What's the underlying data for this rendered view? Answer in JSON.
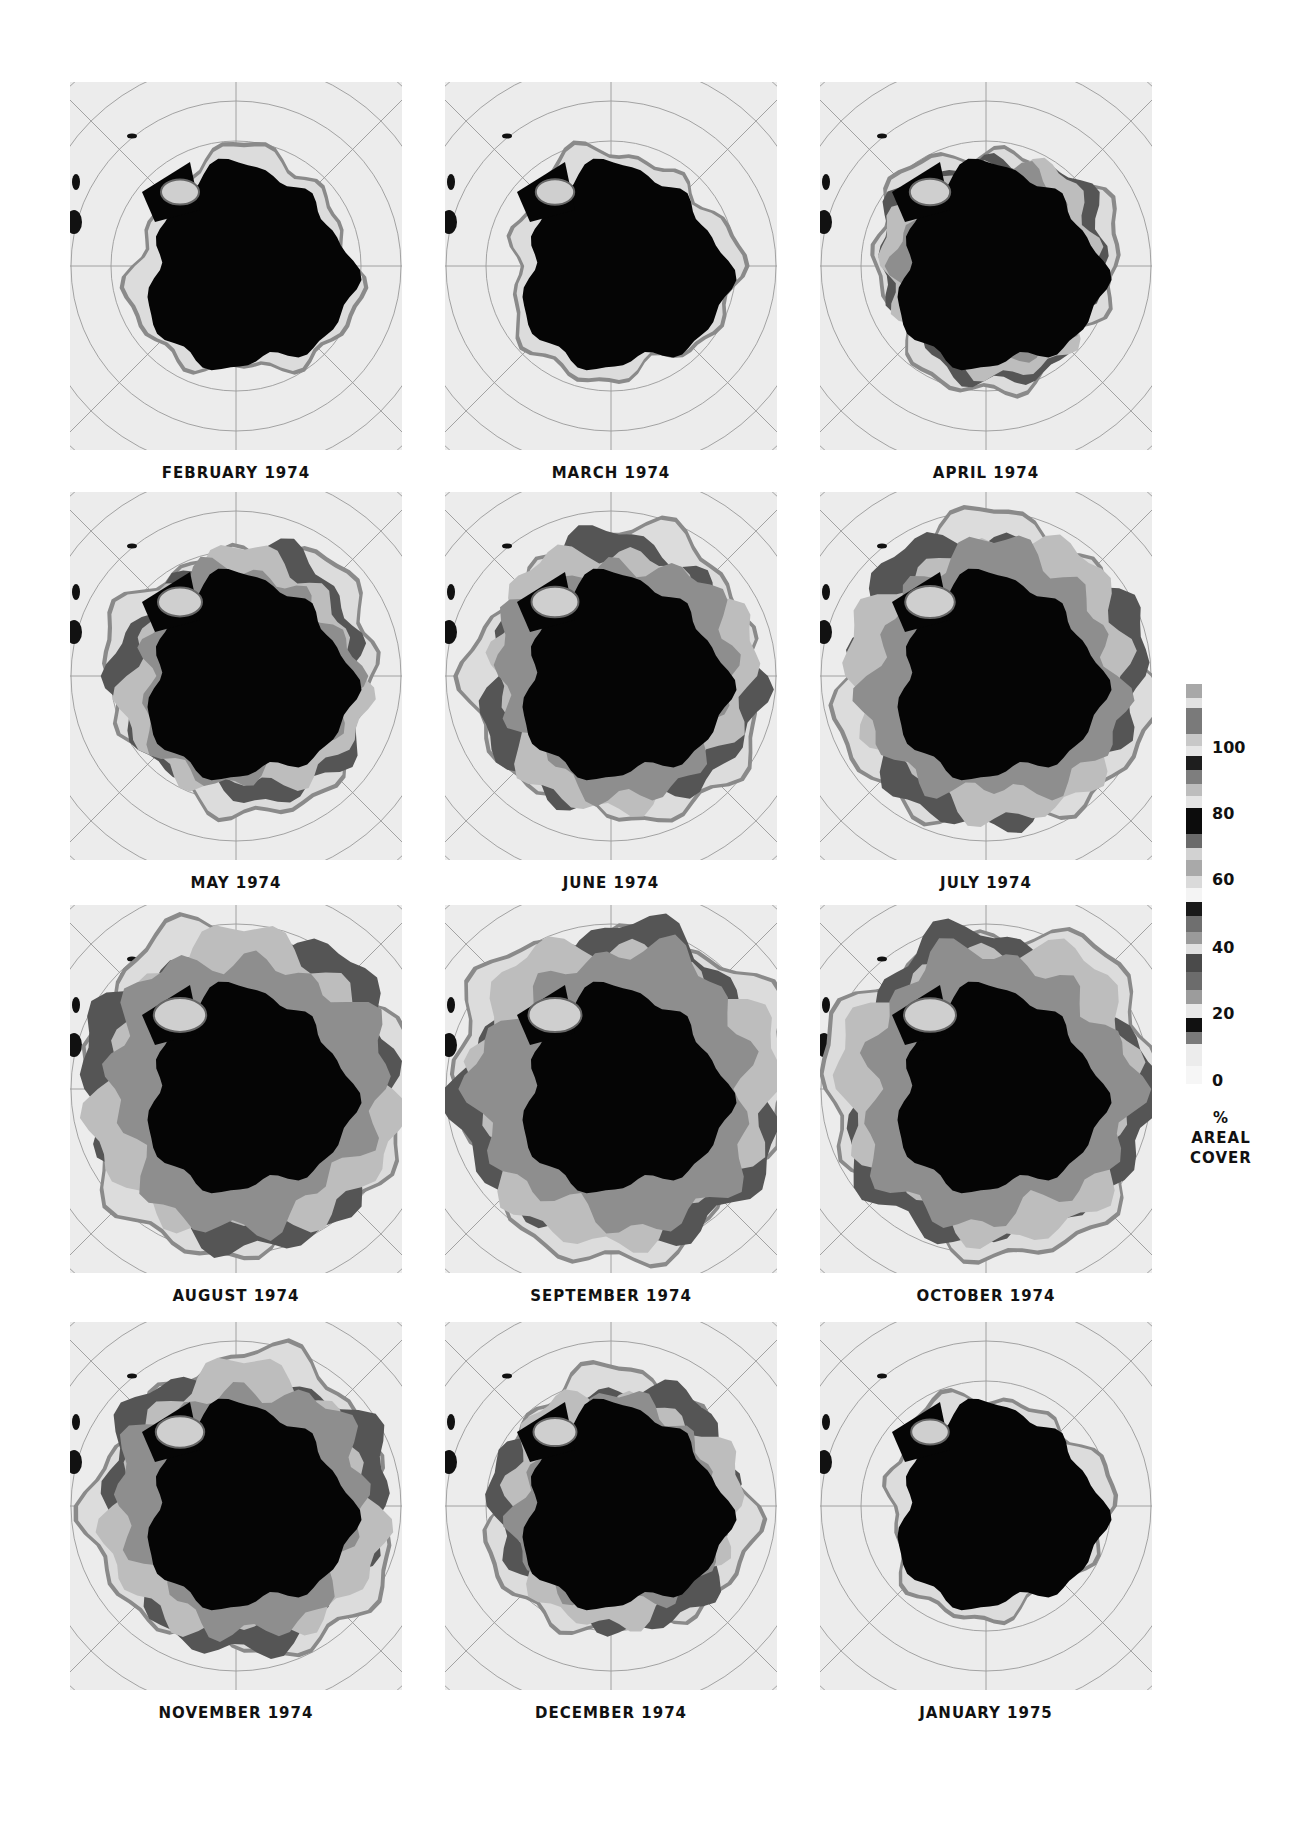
{
  "chart_data": {
    "type": "heatmap",
    "title": "",
    "panels": [
      {
        "label": "FEBRUARY 1974",
        "ice_extent": 0.1
      },
      {
        "label": "MARCH 1974",
        "ice_extent": 0.12
      },
      {
        "label": "APRIL 1974",
        "ice_extent": 0.22
      },
      {
        "label": "MAY 1974",
        "ice_extent": 0.4
      },
      {
        "label": "JUNE 1974",
        "ice_extent": 0.55
      },
      {
        "label": "JULY 1974",
        "ice_extent": 0.68
      },
      {
        "label": "AUGUST 1974",
        "ice_extent": 0.82
      },
      {
        "label": "SEPTEMBER 1974",
        "ice_extent": 0.85
      },
      {
        "label": "OCTOBER 1974",
        "ice_extent": 0.8
      },
      {
        "label": "NOVEMBER 1974",
        "ice_extent": 0.62
      },
      {
        "label": "DECEMBER 1974",
        "ice_extent": 0.35
      },
      {
        "label": "JANUARY 1975",
        "ice_extent": 0.08
      }
    ],
    "colorbar": {
      "label": "% AREAL COVER",
      "unit": "%",
      "ticks": [
        0,
        20,
        40,
        60,
        80,
        100
      ],
      "range": [
        0,
        100
      ]
    },
    "layout": {
      "rows": 4,
      "cols": 3,
      "legend_position": "right",
      "grid": "polar graticule"
    }
  },
  "legend": {
    "ticks": [
      "100",
      "80",
      "60",
      "40",
      "20",
      "0"
    ],
    "title_line1": "%",
    "title_line2": "AREAL",
    "title_line3": "COVER"
  }
}
